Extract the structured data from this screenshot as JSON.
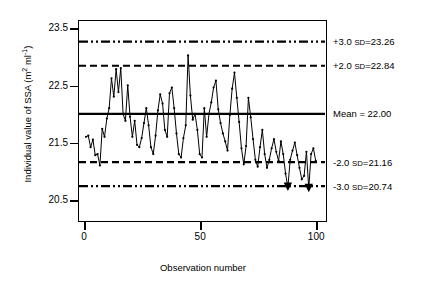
{
  "chart_data": {
    "type": "line",
    "title": "",
    "xlabel": "Observation number",
    "ylabel": "Individual value of SSA (m² ml⁻¹)",
    "ylabel_main": "Individual value of SSA (m",
    "ylabel_sup1": "2",
    "ylabel_mid": " ml",
    "ylabel_sup2": "-1",
    "ylabel_end": ")",
    "xlim": [
      -2,
      104
    ],
    "ylim": [
      20.15,
      23.62
    ],
    "grid": false,
    "legend": "none",
    "yticks": [
      "20.5",
      "21.5",
      "22.5",
      "23.5"
    ],
    "ytick_values": [
      20.5,
      21.5,
      22.5,
      23.5
    ],
    "xticks": [
      "0",
      "50",
      "100"
    ],
    "xtick_values": [
      0,
      50,
      100
    ],
    "series_name": "Individual value of SSA",
    "x": [
      1,
      2,
      3,
      4,
      5,
      6,
      7,
      8,
      9,
      10,
      11,
      12,
      13,
      14,
      15,
      16,
      17,
      18,
      19,
      20,
      21,
      22,
      23,
      24,
      25,
      26,
      27,
      28,
      29,
      30,
      31,
      32,
      33,
      34,
      35,
      36,
      37,
      38,
      39,
      40,
      41,
      42,
      43,
      44,
      45,
      46,
      47,
      48,
      49,
      50,
      51,
      52,
      53,
      54,
      55,
      56,
      57,
      58,
      59,
      60,
      61,
      62,
      63,
      64,
      65,
      66,
      67,
      68,
      69,
      70,
      71,
      72,
      73,
      74,
      75,
      76,
      77,
      78,
      79,
      80,
      81,
      82,
      83,
      84,
      85,
      86,
      87,
      88,
      89,
      90,
      91,
      92,
      93,
      94,
      95,
      96,
      97,
      98,
      99,
      100
    ],
    "values": [
      21.6,
      21.62,
      21.42,
      21.55,
      21.28,
      21.3,
      21.1,
      21.74,
      21.6,
      21.92,
      22.1,
      22.62,
      22.3,
      22.78,
      22.38,
      22.8,
      22.0,
      21.88,
      22.5,
      21.95,
      21.6,
      21.88,
      21.46,
      21.42,
      21.58,
      21.84,
      22.1,
      21.8,
      21.42,
      21.3,
      21.62,
      22.06,
      22.34,
      22.18,
      21.72,
      21.6,
      22.36,
      22.46,
      22.1,
      21.66,
      21.3,
      21.24,
      21.58,
      21.8,
      23.02,
      22.32,
      21.9,
      22.0,
      21.72,
      21.3,
      21.24,
      22.1,
      21.6,
      22.0,
      22.2,
      22.46,
      22.58,
      22.08,
      21.84,
      21.66,
      21.52,
      21.36,
      21.98,
      22.44,
      22.72,
      22.28,
      21.86,
      21.4,
      21.12,
      21.44,
      22.28,
      21.94,
      21.56,
      21.2,
      21.08,
      21.42,
      21.72,
      21.3,
      21.06,
      21.2,
      21.4,
      21.56,
      21.34,
      21.18,
      21.52,
      21.3,
      20.96,
      20.72,
      21.2,
      21.36,
      21.5,
      21.28,
      21.06,
      20.86,
      20.92,
      21.34,
      20.7,
      21.3,
      21.4,
      21.18
    ],
    "outlier_points": [
      {
        "x": 88,
        "y": 20.72,
        "marker": "triangle-down"
      },
      {
        "x": 97,
        "y": 20.7,
        "marker": "triangle-down"
      }
    ],
    "reference_lines": [
      {
        "key": "plus3sd",
        "value": 23.26,
        "label_prefix": "+3.0 ",
        "label_sd": "SD",
        "label_value": "=23.26",
        "style": "dash-dot-dot"
      },
      {
        "key": "plus2sd",
        "value": 22.84,
        "label_prefix": "+2.0 ",
        "label_sd": "SD",
        "label_value": "=22.84",
        "style": "dashed"
      },
      {
        "key": "mean",
        "value": 22.0,
        "label_prefix": "Mean = 22.00",
        "label_sd": "",
        "label_value": "",
        "style": "solid"
      },
      {
        "key": "minus2sd",
        "value": 21.16,
        "label_prefix": "-2.0 ",
        "label_sd": "SD",
        "label_value": "=21.16",
        "style": "dashed"
      },
      {
        "key": "minus3sd",
        "value": 20.74,
        "label_prefix": "-3.0 ",
        "label_sd": "SD",
        "label_value": "=20.74",
        "style": "dash-dot-dot"
      }
    ],
    "line_color": "#000000",
    "marker_color": "#000000",
    "background": "#ffffff"
  }
}
